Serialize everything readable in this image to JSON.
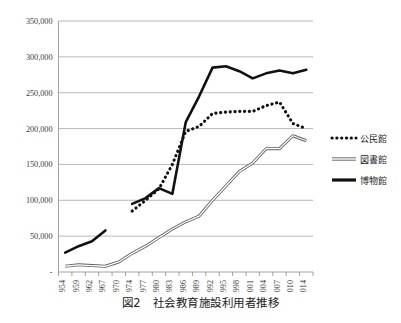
{
  "caption": "図2　社会教育施設利用者推移",
  "axis": {
    "y_ticks": [
      "350,000",
      "300,000",
      "250,000",
      "200,000",
      "150,000",
      "100,000",
      "50,000",
      "-"
    ],
    "x_ticks": [
      "1954",
      "1959",
      "1962",
      "1967",
      "1970",
      "1974",
      "1977",
      "1980",
      "1983",
      "1986",
      "1989",
      "1992",
      "1995",
      "1998",
      "2001",
      "2004",
      "2007",
      "2010",
      "2014"
    ]
  },
  "legend": {
    "items": [
      {
        "label": "公民館",
        "style": "dotted",
        "color": "#111111"
      },
      {
        "label": "図書館",
        "style": "double",
        "color": "#6e6e6e"
      },
      {
        "label": "博物館",
        "style": "solid",
        "color": "#111111"
      }
    ]
  },
  "chart_data": {
    "type": "line",
    "title": "図2　社会教育施設利用者推移",
    "xlabel": "",
    "ylabel": "",
    "ylim": [
      0,
      350000
    ],
    "grid": true,
    "legend_position": "right",
    "categories": [
      "1954",
      "1959",
      "1962",
      "1967",
      "1970",
      "1974",
      "1977",
      "1980",
      "1983",
      "1986",
      "1989",
      "1992",
      "1995",
      "1998",
      "2001",
      "2004",
      "2007",
      "2010",
      "2014"
    ],
    "series": [
      {
        "name": "公民館",
        "style": "dotted",
        "values": [
          null,
          null,
          null,
          null,
          null,
          85000,
          100000,
          116000,
          150000,
          196000,
          203000,
          221000,
          223000,
          224000,
          224000,
          232000,
          237000,
          207000,
          200000
        ]
      },
      {
        "name": "図書館",
        "style": "double",
        "values": [
          8000,
          10000,
          9000,
          8000,
          14000,
          26000,
          36000,
          48000,
          60000,
          70000,
          78000,
          100000,
          120000,
          140000,
          152000,
          172000,
          172000,
          190000,
          183000
        ]
      },
      {
        "name": "博物館",
        "style": "solid",
        "values": [
          27000,
          36000,
          43000,
          58000,
          null,
          95000,
          103000,
          117000,
          109000,
          209000,
          245000,
          285000,
          287000,
          280000,
          270000,
          277000,
          281000,
          277000,
          282000
        ]
      }
    ]
  }
}
